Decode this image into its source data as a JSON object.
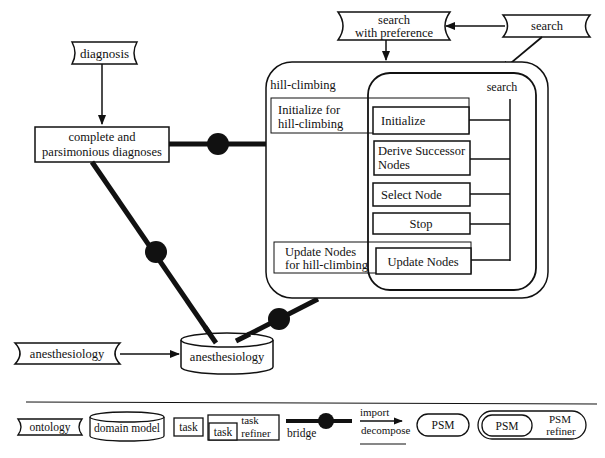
{
  "nodes": {
    "diagnosis_ontology": "diagnosis",
    "complete_task_line1": "complete and",
    "complete_task_line2": "parsimonious diagnoses",
    "search_pref_line1": "search",
    "search_pref_line2": "with preference",
    "search_ontology": "search",
    "hill_climbing_label": "hill-climbing",
    "search_psm_label": "search",
    "init_refiner_line1": "Initialize for",
    "init_refiner_line2": "hill-climbing",
    "initialize_task": "Initialize",
    "derive_line1": "Derive Successor",
    "derive_line2": "Nodes",
    "select_node": "Select Node",
    "stop": "Stop",
    "update_refiner_line1": "Update Nodes",
    "update_refiner_line2": "for hill-climbing",
    "update_nodes": "Update Nodes",
    "anesthesiology_ontology": "anesthesiology",
    "anesthesiology_domain": "anesthesiology"
  },
  "legend": {
    "ontology": "ontology",
    "domain_model": "domain model",
    "task": "task",
    "task_inner": "task",
    "task_refiner_line1": "task",
    "task_refiner_line2": "refiner",
    "bridge": "bridge",
    "import": "import",
    "decompose": "decompose",
    "psm": "PSM",
    "psm_inner": "PSM",
    "psm_refiner_line1": "PSM",
    "psm_refiner_line2": "refiner"
  },
  "colors": {
    "stroke": "#111111",
    "background": "#ffffff"
  }
}
